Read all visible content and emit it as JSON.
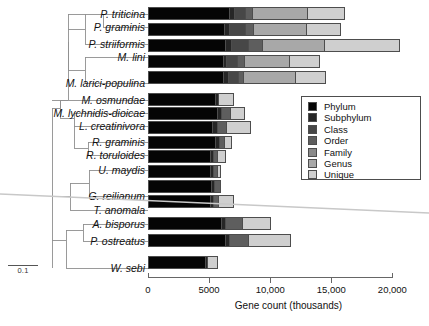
{
  "chart_data": {
    "type": "bar",
    "orientation": "horizontal",
    "stacked": true,
    "title": "",
    "xlabel": "Gene count (thousands)",
    "ylabel": "",
    "xlim": [
      0,
      20500
    ],
    "xticks": [
      0,
      5000,
      10000,
      15000,
      20000
    ],
    "xticklabels": [
      "0",
      "5000",
      "10,000",
      "15,000",
      "20,000"
    ],
    "grid": false,
    "legend_position": "center-right",
    "categories": [
      "P. triticina",
      "P. graminis",
      "P. striiformis",
      "M. lini",
      "M. larici-populina",
      "M. osmundae",
      "M. lychnidis-dioicae",
      "L. creatinivora",
      "R. graminis",
      "R. toruloides",
      "U. maydis",
      "G. reilianum",
      "T. anomala",
      "A. bisporus",
      "P. ostreatus",
      "W. sebi"
    ],
    "series": [
      {
        "name": "Phylum",
        "color": "#050505",
        "values": [
          6600,
          6200,
          6300,
          6100,
          6100,
          5500,
          5700,
          5300,
          5500,
          5100,
          5100,
          5200,
          5100,
          6000,
          6300,
          4700
        ]
      },
      {
        "name": "Subphylum",
        "color": "#262626",
        "values": [
          400,
          400,
          500,
          300,
          400,
          250,
          350,
          400,
          350,
          300,
          300,
          300,
          300,
          300,
          300,
          200
        ]
      },
      {
        "name": "Class",
        "color": "#474747",
        "values": [
          900,
          1300,
          1400,
          900,
          900,
          0,
          0,
          0,
          0,
          0,
          0,
          0,
          0,
          0,
          0,
          0
        ]
      },
      {
        "name": "Order",
        "color": "#5e5e5e",
        "values": [
          600,
          700,
          1100,
          600,
          400,
          0,
          700,
          750,
          400,
          350,
          300,
          450,
          400,
          1400,
          1600,
          0
        ]
      },
      {
        "name": "Family",
        "color": "#8a8a8a",
        "values": [
          0,
          0,
          0,
          0,
          0,
          0,
          0,
          0,
          0,
          0,
          0,
          0,
          0,
          0,
          0,
          0
        ]
      },
      {
        "name": "Genus",
        "color": "#a8a8a8",
        "values": [
          4600,
          4400,
          5100,
          3700,
          4300,
          0,
          0,
          0,
          0,
          0,
          0,
          0,
          0,
          0,
          0,
          0
        ]
      },
      {
        "name": "Unique",
        "color": "#cfcfcf",
        "values": [
          3000,
          2800,
          6200,
          2500,
          2500,
          1300,
          1200,
          2000,
          600,
          600,
          300,
          0,
          1200,
          2400,
          3500,
          800
        ]
      }
    ],
    "totals": [
      16100,
      15800,
      20600,
      14100,
      14600,
      7050,
      7950,
      8450,
      6850,
      6350,
      6000,
      5950,
      7000,
      10100,
      11700,
      5700
    ],
    "legend_entries": [
      "Phylum",
      "Subphylum",
      "Class",
      "Order",
      "Family",
      "Genus",
      "Unique"
    ]
  },
  "tree": {
    "scalebar_label": "0.1",
    "taxa": [
      "P. triticina",
      "P. graminis",
      "P. striiformis",
      "M. lini",
      "M. larici-populina",
      "M. osmundae",
      "M. lychnidis-dioicae",
      "L. creatinivora",
      "R. graminis",
      "R. toruloides",
      "U. maydis",
      "G. reilianum",
      "T. anomala",
      "A. bisporus",
      "P. ostreatus",
      "W. sebi"
    ]
  },
  "colors": {
    "phylum": "#050505",
    "subphylum": "#262626",
    "class": "#474747",
    "order": "#5e5e5e",
    "family": "#8a8a8a",
    "genus": "#a8a8a8",
    "unique": "#cfcfcf",
    "axis": "#666666",
    "outline": "#4d4d4d",
    "background": "#ffffff"
  }
}
